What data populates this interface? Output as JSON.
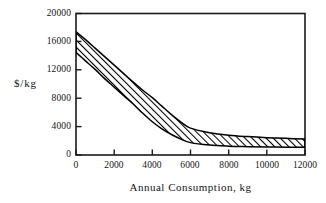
{
  "chart_data": {
    "type": "area",
    "title": "",
    "subtitle": "",
    "xlabel": "Annual Consumption, kg",
    "ylabel": "$/kg",
    "xlim": [
      0,
      12000
    ],
    "ylim": [
      0,
      20000
    ],
    "xticks": [
      0,
      2000,
      4000,
      6000,
      8000,
      10000,
      12000
    ],
    "yticks": [
      0,
      4000,
      8000,
      12000,
      16000,
      20000
    ],
    "xtick_labels": [
      "0",
      "2000",
      "4000",
      "6000",
      "8000",
      "10000",
      "12000"
    ],
    "ytick_labels": [
      "0",
      "4000",
      "8000",
      "12000",
      "16000",
      "20000"
    ],
    "grid": false,
    "legend": null,
    "legend_position": "none",
    "fill": "diagonal-hatch",
    "colors": {
      "line": "#000000",
      "hatch": "#000000",
      "background": "#ffffff",
      "axis": "#1a1a1a"
    },
    "x": [
      0,
      500,
      1000,
      1500,
      2000,
      2500,
      3000,
      3500,
      4000,
      4500,
      5000,
      5500,
      6000,
      7000,
      8000,
      9000,
      10000,
      11000,
      12000
    ],
    "series": [
      {
        "name": "upper bound",
        "values": [
          17400,
          16300,
          15100,
          13900,
          12700,
          11500,
          10300,
          9150,
          8100,
          6900,
          5700,
          4650,
          3800,
          3150,
          2800,
          2600,
          2450,
          2350,
          2250
        ]
      },
      {
        "name": "lower bound",
        "values": [
          14500,
          13300,
          12100,
          10800,
          9600,
          8400,
          7200,
          5900,
          4700,
          3700,
          2900,
          2250,
          1750,
          1400,
          1250,
          1180,
          1130,
          1100,
          1080
        ]
      }
    ],
    "annotations": []
  },
  "figure": {
    "y_axis_title": "$/kg",
    "x_axis_title": "Annual Consumption, kg"
  }
}
